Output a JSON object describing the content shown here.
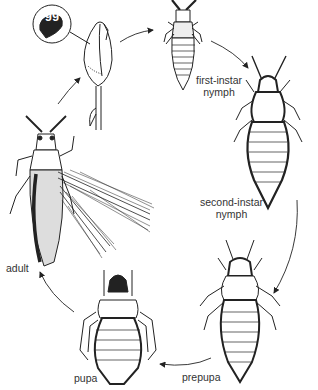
{
  "diagram": {
    "type": "life-cycle",
    "stages": [
      {
        "id": "egg",
        "label": "egg"
      },
      {
        "id": "first-instar",
        "label_line1": "first-instar",
        "label_line2": "nymph"
      },
      {
        "id": "second-instar",
        "label_line1": "second-instar",
        "label_line2": "nymph"
      },
      {
        "id": "prepupa",
        "label": "prepupa"
      },
      {
        "id": "pupa",
        "label": "pupa"
      },
      {
        "id": "adult",
        "label": "adult"
      }
    ],
    "colors": {
      "line": "#222222",
      "text": "#333333",
      "background": "#ffffff"
    }
  }
}
